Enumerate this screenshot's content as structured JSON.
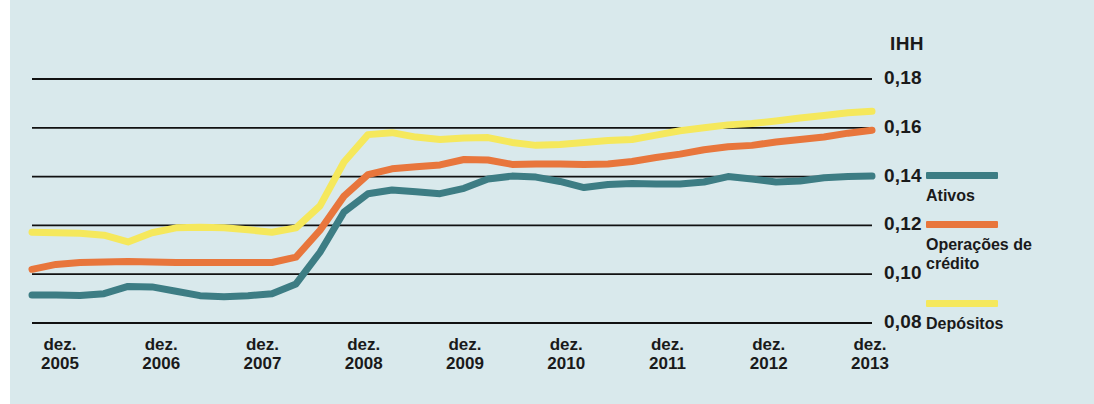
{
  "chart_data": {
    "type": "line",
    "title": "",
    "subtitle": "",
    "xlabel": "",
    "ylabel": "IHH",
    "unit_label": "IHH",
    "grid": true,
    "grid_axis": "y",
    "legend_position": "right",
    "background_color": "#d9e9ec",
    "gridline_color": "#111111",
    "ylim": [
      0.08,
      0.18
    ],
    "yticks": [
      0.08,
      0.1,
      0.12,
      0.14,
      0.16,
      0.18
    ],
    "ytick_labels": [
      "0,08",
      "0,10",
      "0,12",
      "0,14",
      "0,16",
      "0,18"
    ],
    "x": [
      "dez. 2005",
      "dez. 2006",
      "dez. 2007",
      "dez. 2008",
      "dez. 2009",
      "dez. 2010",
      "dez. 2011",
      "dez. 2012",
      "dez. 2013"
    ],
    "xtick_labels": [
      "dez.\n2005",
      "dez.\n2006",
      "dez.\n2007",
      "dez.\n2008",
      "dez.\n2009",
      "dez.\n2010",
      "dez.\n2011",
      "dez.\n2012",
      "dez.\n2013"
    ],
    "series": [
      {
        "name": "Ativos",
        "color": "#3d7d84",
        "x": [
          2005.0,
          2005.25,
          2005.5,
          2005.75,
          2006.0,
          2006.25,
          2006.5,
          2006.75,
          2007.0,
          2007.25,
          2007.5,
          2007.75,
          2008.0,
          2008.25,
          2008.5,
          2008.75,
          2009.0,
          2009.25,
          2009.5,
          2009.75,
          2010.0,
          2010.25,
          2010.5,
          2010.75,
          2011.0,
          2011.25,
          2011.5,
          2011.75,
          2012.0,
          2012.25,
          2012.5,
          2012.75,
          2013.0,
          2013.25,
          2013.5,
          2013.75
        ],
        "values": [
          0.0915,
          0.0915,
          0.0913,
          0.092,
          0.095,
          0.0948,
          0.093,
          0.0912,
          0.0908,
          0.0912,
          0.092,
          0.096,
          0.109,
          0.1255,
          0.133,
          0.1345,
          0.1338,
          0.133,
          0.1352,
          0.139,
          0.1402,
          0.1398,
          0.138,
          0.1355,
          0.1368,
          0.1372,
          0.137,
          0.137,
          0.1378,
          0.14,
          0.139,
          0.1378,
          0.1382,
          0.1395,
          0.14,
          0.1402
        ]
      },
      {
        "name": "Operações de crédito",
        "color": "#e8763c",
        "x": [
          2005.0,
          2005.25,
          2005.5,
          2005.75,
          2006.0,
          2006.25,
          2006.5,
          2006.75,
          2007.0,
          2007.25,
          2007.5,
          2007.75,
          2008.0,
          2008.25,
          2008.5,
          2008.75,
          2009.0,
          2009.25,
          2009.5,
          2009.75,
          2010.0,
          2010.25,
          2010.5,
          2010.75,
          2011.0,
          2011.25,
          2011.5,
          2011.75,
          2012.0,
          2012.25,
          2012.5,
          2012.75,
          2013.0,
          2013.25,
          2013.5,
          2013.75
        ],
        "values": [
          0.102,
          0.104,
          0.1048,
          0.105,
          0.1052,
          0.105,
          0.1048,
          0.1048,
          0.1048,
          0.1048,
          0.1048,
          0.107,
          0.118,
          0.132,
          0.1408,
          0.1432,
          0.144,
          0.1448,
          0.147,
          0.1468,
          0.145,
          0.1452,
          0.1452,
          0.145,
          0.1452,
          0.1462,
          0.1478,
          0.1492,
          0.151,
          0.1522,
          0.1528,
          0.1542,
          0.1552,
          0.1562,
          0.1578,
          0.159
        ]
      },
      {
        "name": "Depósitos",
        "color": "#f5e85c",
        "x": [
          2005.0,
          2005.25,
          2005.5,
          2005.75,
          2006.0,
          2006.25,
          2006.5,
          2006.75,
          2007.0,
          2007.25,
          2007.5,
          2007.75,
          2008.0,
          2008.25,
          2008.5,
          2008.75,
          2009.0,
          2009.25,
          2009.5,
          2009.75,
          2010.0,
          2010.25,
          2010.5,
          2010.75,
          2011.0,
          2011.25,
          2011.5,
          2011.75,
          2012.0,
          2012.25,
          2012.5,
          2012.75,
          2013.0,
          2013.25,
          2013.5,
          2013.75
        ],
        "values": [
          0.1172,
          0.117,
          0.1168,
          0.116,
          0.1132,
          0.117,
          0.119,
          0.1192,
          0.119,
          0.1182,
          0.1172,
          0.119,
          0.128,
          0.146,
          0.1572,
          0.158,
          0.1562,
          0.1552,
          0.1558,
          0.156,
          0.154,
          0.1528,
          0.1532,
          0.154,
          0.1548,
          0.1552,
          0.157,
          0.1588,
          0.16,
          0.1612,
          0.1618,
          0.1628,
          0.164,
          0.165,
          0.1662,
          0.1668
        ]
      }
    ],
    "legend": [
      {
        "label": "Ativos",
        "color": "#3d7d84"
      },
      {
        "label": "Operações de\ncrédito",
        "color": "#e8763c"
      },
      {
        "label": "Depósitos",
        "color": "#f5e85c"
      }
    ]
  }
}
